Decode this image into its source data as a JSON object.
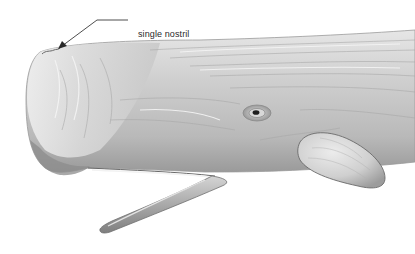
{
  "illustration": {
    "subject": "sperm whale head",
    "annotations": [
      {
        "label": "single nostril"
      }
    ],
    "colors": {
      "background": "#ffffff",
      "body_light": "#e4e4e4",
      "body_mid": "#bdbdbd",
      "body_dark": "#8a8a8a",
      "outline": "#555555",
      "label_text": "#2a2a2a"
    }
  }
}
